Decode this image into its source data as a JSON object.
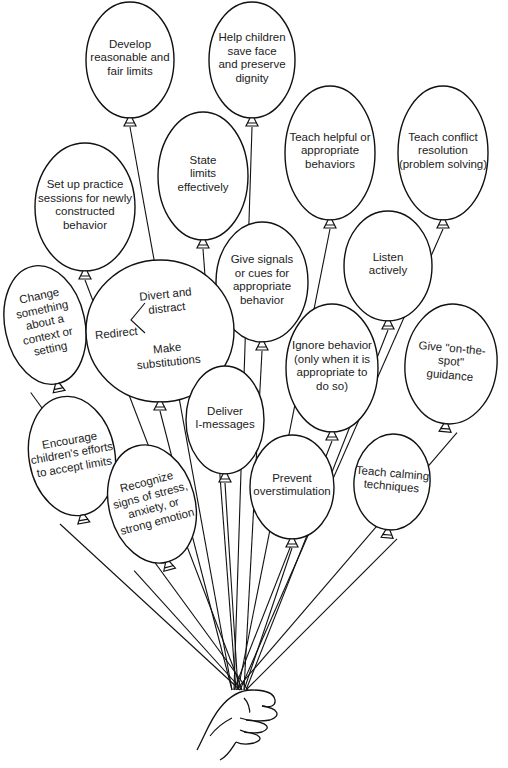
{
  "diagram": {
    "type": "balloon-bouquet",
    "hand_anchor": {
      "x": 240,
      "y": 690
    },
    "line_color": "#111111",
    "fill_color": "#ffffff",
    "balloons": [
      {
        "id": "develop-limits",
        "text": "Develop\nreasonable and\nfair limits",
        "cx": 130,
        "cy": 60,
        "rx": 44,
        "ry": 58,
        "rot": 0
      },
      {
        "id": "save-face",
        "text": "Help children\nsave face\nand preserve\ndignity",
        "cx": 252,
        "cy": 60,
        "rx": 43,
        "ry": 58,
        "rot": 0
      },
      {
        "id": "state-limits",
        "text": "State\nlimits\neffectively",
        "cx": 203,
        "cy": 176,
        "rx": 45,
        "ry": 64,
        "rot": 0
      },
      {
        "id": "teach-helpful",
        "text": "Teach helpful or\nappropriate\nbehaviors",
        "cx": 330,
        "cy": 153,
        "rx": 45,
        "ry": 67,
        "rot": 0
      },
      {
        "id": "conflict-resolution",
        "text": "Teach conflict\nresolution\n(problem solving)",
        "cx": 443,
        "cy": 153,
        "rx": 45,
        "ry": 67,
        "rot": 0
      },
      {
        "id": "practice-sessions",
        "text": "Set up practice\nsessions for newly\nconstructed\nbehavior",
        "cx": 85,
        "cy": 207,
        "rx": 50,
        "ry": 64,
        "rot": 0
      },
      {
        "id": "give-signals",
        "text": "Give signals\nor cues for\nappropriate\nbehavior",
        "cx": 262,
        "cy": 282,
        "rx": 46,
        "ry": 60,
        "rot": 0
      },
      {
        "id": "listen",
        "text": "Listen\nactively",
        "cx": 388,
        "cy": 266,
        "rx": 44,
        "ry": 55,
        "rot": 0
      },
      {
        "id": "change-context",
        "text": "Change\nsomething\nabout a\ncontext or\nsetting",
        "cx": 45,
        "cy": 325,
        "rx": 40,
        "ry": 60,
        "rot": -12
      },
      {
        "id": "redirect",
        "text": "",
        "cx": 160,
        "cy": 331,
        "rx": 74,
        "ry": 71,
        "rot": 0
      },
      {
        "id": "ignore-behavior",
        "text": "Ignore behavior\n(only when it is\nappropriate to\ndo so)",
        "cx": 332,
        "cy": 368,
        "rx": 46,
        "ry": 64,
        "rot": 0
      },
      {
        "id": "on-the-spot",
        "text": "Give \"on-the-spot\"\nguidance",
        "cx": 451,
        "cy": 364,
        "rx": 46,
        "ry": 60,
        "rot": 5
      },
      {
        "id": "deliver-i-messages",
        "text": "Deliver\nI-messages",
        "cx": 225,
        "cy": 420,
        "rx": 39,
        "ry": 54,
        "rot": 0
      },
      {
        "id": "encourage-accept",
        "text": "Encourage\nchildren's efforts\nto accept limits",
        "cx": 72,
        "cy": 456,
        "rx": 43,
        "ry": 60,
        "rot": -10
      },
      {
        "id": "recognize-stress",
        "text": "Recognize\nsigns of stress,\nanxiety, or\nstrong emotion",
        "cx": 152,
        "cy": 504,
        "rx": 43,
        "ry": 60,
        "rot": -15
      },
      {
        "id": "prevent-overstim",
        "text": "Prevent\noverstimulation",
        "cx": 292,
        "cy": 487,
        "rx": 42,
        "ry": 52,
        "rot": 0
      },
      {
        "id": "teach-calming",
        "text": "Teach calming\ntechniques",
        "cx": 392,
        "cy": 482,
        "rx": 38,
        "ry": 48,
        "rot": 5
      }
    ],
    "redirect": {
      "main": "Redirect",
      "branch_top": "Divert and\ndistract",
      "branch_bottom": "Make\nsubstitutions"
    }
  }
}
